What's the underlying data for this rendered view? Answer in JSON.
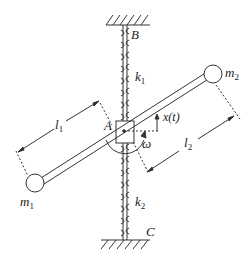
{
  "diagram": {
    "labels": {
      "B": "B",
      "C": "C",
      "A": "A",
      "k1": {
        "base": "k",
        "sub": "1"
      },
      "k2": {
        "base": "k",
        "sub": "2"
      },
      "m1": {
        "base": "m",
        "sub": "1"
      },
      "m2": {
        "base": "m",
        "sub": "2"
      },
      "l1": {
        "base": "l",
        "sub": "1"
      },
      "l2": {
        "base": "l",
        "sub": "2"
      },
      "x": "x(t)",
      "omega": "ω"
    },
    "colors": {
      "stroke": "#333333",
      "background": "#ffffff"
    }
  }
}
